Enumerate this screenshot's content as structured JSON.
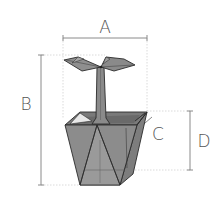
{
  "diagram": {
    "labels": {
      "A": "A",
      "B": "B",
      "C": "C",
      "D": "D"
    },
    "dimensions": [
      {
        "id": "A",
        "meaning": "overall width",
        "orientation": "horizontal"
      },
      {
        "id": "B",
        "meaning": "overall height",
        "orientation": "vertical"
      },
      {
        "id": "C",
        "meaning": "pot wall / rim thickness",
        "orientation": "pointer"
      },
      {
        "id": "D",
        "meaning": "pot height",
        "orientation": "vertical"
      }
    ],
    "colors": {
      "pot_fill": "#8c8c8c",
      "pot_dark": "#6f6f6f",
      "pot_light": "#a8a8a8",
      "outline": "#2a2a2a",
      "dimension_line": "#8a8a8a",
      "label": "#555555"
    }
  }
}
